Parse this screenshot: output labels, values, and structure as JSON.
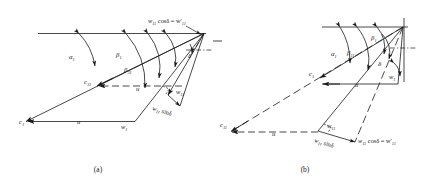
{
  "figure": {
    "type": "velocity-triangle-diagram",
    "panels": [
      {
        "id": "a",
        "caption": "(a)",
        "labels": {
          "c1": "c",
          "c1_sub": "1",
          "c31": "c",
          "c31_sub": "31",
          "w1": "w",
          "w1_sub": "1",
          "w11": "w",
          "w11_sub": "11",
          "u_lower": "u",
          "u_upper": "u",
          "alpha1": "α",
          "alpha1_sub": "1",
          "beta1": "β",
          "beta1_sub": "1",
          "beta31": "β",
          "beta31_sub": "31",
          "delta": "δ",
          "w11sin": "w",
          "w11sin_sub": "11",
          "w11sin_rest": " sinδ",
          "w11cos_head": "w",
          "w11cos_head_sub": "11",
          "w11cos_rest": "  cosδ = w′",
          "w11cos_tail_sub": "11"
        }
      },
      {
        "id": "b",
        "caption": "(b)",
        "labels": {
          "c1": "c",
          "c1_sub": "1",
          "c11": "c",
          "c11_sub": "11",
          "w1": "w",
          "w1_sub": "1",
          "w11": "w",
          "w11_sub": "11",
          "u_upper": "u",
          "u_lower": "u",
          "alpha1": "α",
          "alpha1_sub": "1",
          "beta1": "β",
          "beta1_sub": "1",
          "beta11": "β",
          "beta11_sub": "11",
          "delta": "δ",
          "w11sin": "w",
          "w11sin_sub": "11",
          "w11sin_rest": " sinδ",
          "w11cos_head": "w",
          "w11cos_head_sub": "11",
          "w11cos_rest": "  cosδ = w′",
          "w11cos_tail_sub": "11"
        }
      }
    ],
    "colors": {
      "stroke": "#1a1a1a",
      "background": "#ffffff"
    }
  }
}
